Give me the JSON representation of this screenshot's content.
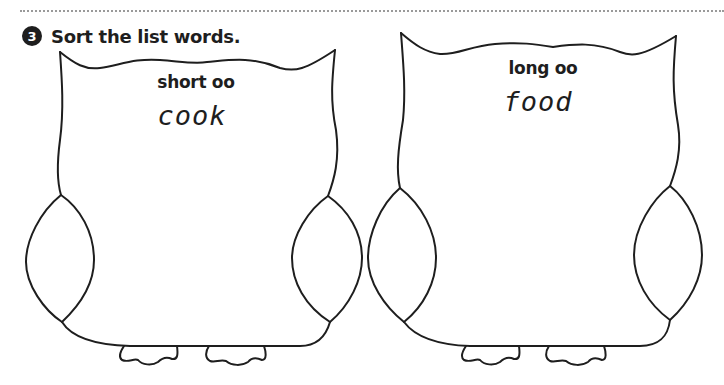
{
  "header": {
    "exercise_number": "3",
    "instruction": "Sort the list words."
  },
  "owls": [
    {
      "category_label": "short oo",
      "word": "cook"
    },
    {
      "category_label": "long oo",
      "word": "food"
    }
  ],
  "colors": {
    "ink": "#1e1e1e",
    "background": "#ffffff",
    "dotted_rule": "#9a9a9a"
  }
}
